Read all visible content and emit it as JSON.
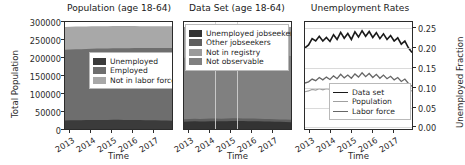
{
  "figure": {
    "width": 465,
    "height": 165,
    "background": "#ffffff",
    "panel_count": 3
  },
  "chart_data": [
    {
      "type": "area",
      "title": "Population (age 18-64)",
      "xlabel": "Time",
      "ylabel": "Total Population",
      "xlim": [
        "2012-09",
        "2017-10"
      ],
      "ylim": [
        0,
        300000
      ],
      "yticks": [
        0,
        50000,
        100000,
        150000,
        200000,
        250000,
        300000
      ],
      "ytick_labels": [
        "0",
        "50000",
        "100000",
        "150000",
        "200000",
        "250000",
        "300000"
      ],
      "xticks": [
        "2013",
        "2014",
        "2015",
        "2016",
        "2017"
      ],
      "grid": false,
      "stacked": true,
      "legend_position": "center-right",
      "x": [
        "2012.75",
        "2013.00",
        "2013.25",
        "2013.50",
        "2013.75",
        "2014.00",
        "2014.25",
        "2014.50",
        "2014.75",
        "2015.00",
        "2015.25",
        "2015.50",
        "2015.75",
        "2016.00",
        "2016.25",
        "2016.50",
        "2016.75",
        "2017.00",
        "2017.25",
        "2017.50",
        "2017.75"
      ],
      "series": [
        {
          "name": "Unemployed",
          "color": "#3b3b3b",
          "values": [
            24000,
            24500,
            24800,
            24600,
            24900,
            25200,
            25400,
            25100,
            25300,
            25600,
            25800,
            25500,
            25400,
            25300,
            25100,
            24800,
            24600,
            24300,
            24000,
            23700,
            23400
          ]
        },
        {
          "name": "Employed",
          "color": "#6e6e6e",
          "values": [
            198000,
            198500,
            199000,
            199200,
            199500,
            199800,
            200000,
            200300,
            200500,
            200700,
            200900,
            201100,
            201300,
            201500,
            201800,
            202100,
            202400,
            202700,
            203000,
            203300,
            203600
          ]
        },
        {
          "name": "Not in labor force",
          "color": "#a8a8a8",
          "values": [
            64000,
            63800,
            63500,
            63400,
            63200,
            63000,
            62800,
            62700,
            62500,
            62300,
            62100,
            62000,
            61800,
            61700,
            61500,
            61400,
            61200,
            61100,
            61000,
            60900,
            60800
          ]
        }
      ]
    },
    {
      "type": "area",
      "title": "Data Set (age 18-64)",
      "xlabel": "Time",
      "ylabel": "",
      "xlim": [
        "2012-09",
        "2017-10"
      ],
      "ylim": [
        0,
        300000
      ],
      "yticks": [],
      "ytick_labels": [],
      "xticks": [
        "2013",
        "2014",
        "2015",
        "2016",
        "2017"
      ],
      "grid": false,
      "stacked": true,
      "legend_position": "upper-center",
      "x": [
        "2012.75",
        "2013.00",
        "2013.25",
        "2013.50",
        "2013.75",
        "2014.00",
        "2014.25",
        "2014.50",
        "2014.75",
        "2015.00",
        "2015.25",
        "2015.50",
        "2015.75",
        "2016.00",
        "2016.25",
        "2016.50",
        "2016.75",
        "2017.00",
        "2017.25",
        "2017.50",
        "2017.75"
      ],
      "series": [
        {
          "name": "Unemployed jobseekers",
          "color": "#333333",
          "values": [
            20500,
            21000,
            21400,
            21000,
            21300,
            21800,
            22000,
            21600,
            21900,
            22400,
            22600,
            22100,
            22000,
            21800,
            21500,
            21100,
            20800,
            20400,
            20000,
            19600,
            19200
          ]
        },
        {
          "name": "Other jobseekers",
          "color": "#5e5e5e",
          "values": [
            7000,
            7100,
            7200,
            7100,
            7200,
            7300,
            7400,
            7300,
            7400,
            7500,
            7500,
            7400,
            7400,
            7300,
            7300,
            7200,
            7100,
            7000,
            6900,
            6800,
            6700
          ]
        },
        {
          "name": "Not in registry",
          "color": "#9a9a9a",
          "values": [
            172000,
            172500,
            173000,
            173300,
            173600,
            174000,
            174300,
            174600,
            175000,
            175300,
            175600,
            176000,
            176300,
            176600,
            177000,
            177400,
            177700,
            178000,
            178400,
            178700,
            179000
          ]
        },
        {
          "name": "Not observable",
          "color": "#808080",
          "values": [
            86500,
            86200,
            85800,
            85600,
            85300,
            85000,
            84700,
            84500,
            84200,
            84000,
            83700,
            83500,
            83200,
            83000,
            82700,
            82500,
            82200,
            82000,
            81700,
            81500,
            81300
          ]
        }
      ]
    },
    {
      "type": "line",
      "title": "Unemployment Rates",
      "xlabel": "Time",
      "ylabel": "Unemployed Fraction",
      "ylabel_position": "right",
      "xlim": [
        "2012-09",
        "2017-10"
      ],
      "ylim": [
        0.0,
        0.27
      ],
      "yticks": [
        0.0,
        0.05,
        0.1,
        0.15,
        0.2,
        0.25
      ],
      "ytick_labels": [
        "0.00",
        "0.05",
        "0.10",
        "0.15",
        "0.20",
        "0.25"
      ],
      "xticks": [
        "2013",
        "2014",
        "2015",
        "2016",
        "2017"
      ],
      "grid": true,
      "legend_position": "lower-center",
      "x": [
        "2012.75",
        "2012.92",
        "2013.08",
        "2013.25",
        "2013.42",
        "2013.58",
        "2013.75",
        "2013.92",
        "2014.08",
        "2014.25",
        "2014.42",
        "2014.58",
        "2014.75",
        "2014.92",
        "2015.08",
        "2015.25",
        "2015.42",
        "2015.58",
        "2015.75",
        "2015.92",
        "2016.08",
        "2016.25",
        "2016.42",
        "2016.58",
        "2016.75",
        "2016.92",
        "2017.08",
        "2017.25",
        "2017.42",
        "2017.58",
        "2017.75"
      ],
      "series": [
        {
          "name": "Data set",
          "color": "#1a1a1a",
          "width": 1.6,
          "values": [
            0.205,
            0.212,
            0.228,
            0.222,
            0.234,
            0.222,
            0.231,
            0.221,
            0.238,
            0.226,
            0.244,
            0.229,
            0.241,
            0.226,
            0.245,
            0.232,
            0.248,
            0.234,
            0.246,
            0.231,
            0.243,
            0.228,
            0.24,
            0.226,
            0.236,
            0.222,
            0.23,
            0.214,
            0.222,
            0.205,
            0.193
          ]
        },
        {
          "name": "Population",
          "color": "#a0a0a0",
          "width": 1.2,
          "values": [
            0.094,
            0.096,
            0.1,
            0.098,
            0.102,
            0.099,
            0.102,
            0.1,
            0.104,
            0.101,
            0.106,
            0.102,
            0.105,
            0.102,
            0.107,
            0.103,
            0.108,
            0.104,
            0.107,
            0.103,
            0.106,
            0.102,
            0.105,
            0.101,
            0.104,
            0.1,
            0.103,
            0.099,
            0.102,
            0.098,
            0.096
          ]
        },
        {
          "name": "Labor force",
          "color": "#666666",
          "width": 1.3,
          "values": [
            0.116,
            0.119,
            0.126,
            0.122,
            0.13,
            0.124,
            0.131,
            0.125,
            0.134,
            0.127,
            0.138,
            0.129,
            0.136,
            0.128,
            0.139,
            0.131,
            0.142,
            0.132,
            0.14,
            0.13,
            0.138,
            0.128,
            0.136,
            0.127,
            0.133,
            0.124,
            0.13,
            0.12,
            0.126,
            0.115,
            0.108
          ]
        }
      ]
    }
  ]
}
